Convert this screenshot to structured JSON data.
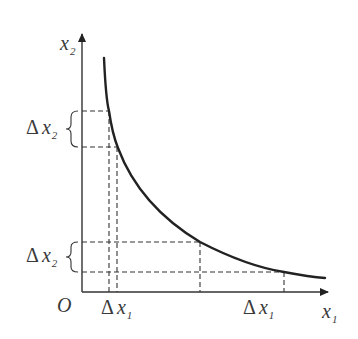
{
  "diagram": {
    "type": "indifference-curve-style diagram",
    "axes": {
      "origin_label": "O",
      "x_label": {
        "base": "x",
        "sub": "1"
      },
      "y_label": {
        "base": "x",
        "sub": "2"
      }
    },
    "curve": {
      "description": "downward-sloping convex curve",
      "stroke": "#222222"
    },
    "annotations": {
      "delta_x2_upper": {
        "delta": "Δ",
        "base": "x",
        "sub": "2"
      },
      "delta_x2_lower": {
        "delta": "Δ",
        "base": "x",
        "sub": "2"
      },
      "delta_x1_left": {
        "delta": "Δ",
        "base": "x",
        "sub": "1"
      },
      "delta_x1_right": {
        "delta": "Δ",
        "base": "x",
        "sub": "1"
      }
    },
    "colors": {
      "line": "#222222",
      "text": "#3a3a3a",
      "background": "#ffffff"
    }
  }
}
